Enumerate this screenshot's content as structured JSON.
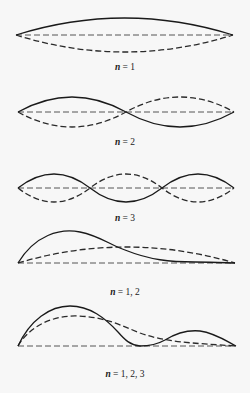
{
  "diagrams": [
    {
      "label_var": "n",
      "label_rest": " = 1",
      "caption": "n = 1"
    },
    {
      "label_var": "n",
      "label_rest": " = 2",
      "caption": "n = 2"
    },
    {
      "label_var": "n",
      "label_rest": " = 3",
      "caption": "n = 3"
    },
    {
      "label_var": "n",
      "label_rest": " = 1, 2",
      "caption": "n = 1, 2"
    },
    {
      "label_var": "n",
      "label_rest": " = 1, 2, 3",
      "caption": "n = 1, 2, 3"
    }
  ],
  "colors": {
    "background": "#f7f7f7",
    "ink": "#1a1a1a"
  }
}
